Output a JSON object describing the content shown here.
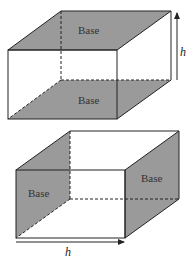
{
  "figure": {
    "colors": {
      "shade": "#9a9a9a",
      "line": "#222222",
      "background": "#ffffff"
    },
    "prism_top": {
      "description": "Rectangular prism with bases on top and bottom; height measured vertically",
      "top_base_label": "Base",
      "bottom_base_label": "Base",
      "height_label": "h",
      "height_arrow_direction": "up"
    },
    "prism_bottom": {
      "description": "Rectangular prism with bases on left and right; height measured horizontally",
      "left_base_label": "Base",
      "right_base_label": "Base",
      "height_label": "h",
      "height_arrow_direction": "right"
    }
  }
}
